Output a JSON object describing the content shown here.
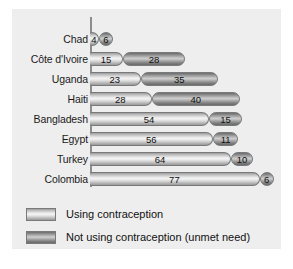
{
  "chart_data": {
    "type": "bar",
    "orientation": "horizontal",
    "stacked": true,
    "title": "",
    "subtitle": "",
    "xlabel": "",
    "ylabel": "",
    "grid": false,
    "xlim": [
      0,
      83
    ],
    "legend_position": "bottom-left",
    "categories": [
      "Chad",
      "Côte d'Ivoire",
      "Uganda",
      "Haiti",
      "Bangladesh",
      "Egypt",
      "Turkey",
      "Colombia"
    ],
    "series": [
      {
        "name": "Using contraception",
        "key": "using",
        "values": [
          4,
          15,
          23,
          28,
          54,
          56,
          64,
          77
        ]
      },
      {
        "name": "Not using contraception (unmet need)",
        "key": "unmet",
        "values": [
          6,
          28,
          35,
          40,
          15,
          11,
          10,
          6
        ]
      }
    ],
    "totals": [
      10,
      43,
      58,
      68,
      69,
      67,
      74,
      83
    ]
  },
  "legend": {
    "items": [
      {
        "label": "Using contraception",
        "key": "using"
      },
      {
        "label": "Not using contraception (unmet need)",
        "key": "unmet"
      }
    ]
  },
  "colors": {
    "panel_background": "#eeeeee",
    "page_background": "#ffffff",
    "axis_line": "#8d8d8d",
    "bar_outline": "#77797a",
    "using_fill_light": "#f4f4f4",
    "using_fill_dark": "#9a9a9a",
    "unmet_fill_light": "#cfcfcf",
    "unmet_fill_dark": "#6a6a6a",
    "text": "#111111"
  }
}
